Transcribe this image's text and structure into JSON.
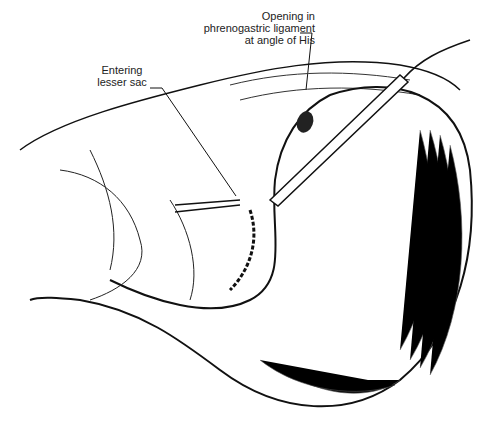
{
  "figure": {
    "labels": {
      "opening": [
        "Opening in",
        "phrenogastric ligament",
        "at angle of His"
      ],
      "lesser_sac": [
        "Entering",
        "lesser sac"
      ]
    },
    "colors": {
      "ink": "#111111",
      "background": "#ffffff"
    }
  }
}
